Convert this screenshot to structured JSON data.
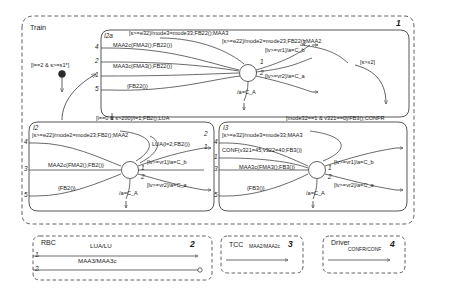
{
  "diagram": {
    "type": "statechart",
    "outer_block": {
      "name": "Train",
      "index": "1"
    },
    "regions": [
      {
        "id": "I2a",
        "name": "I2a",
        "top_labels": [
          "[s>=e32]/mode3=mode33;FB22();MAA3",
          "[s>=e22]/mode2=mode23;FB22();MAA2"
        ],
        "left_ports": [
          "4",
          "2",
          "1",
          "5"
        ],
        "right_ports": [
          "3",
          "1",
          "2"
        ],
        "edge_labels": [
          "MAA2c{FMA2();FB22()}",
          "MAA3c{FMA3();FB22()}",
          "{FB22()}",
          "/a=C_A",
          "[lv>=vr1]/a=C_b",
          "[lv>=vr2]/a=C_a"
        ]
      },
      {
        "id": "I2",
        "name": "I2",
        "top_labels": [
          "[l==0 & s>200]/l=1;FB2();LUA",
          "[s>=e22]/mode2=mode23;FB2();MAA2"
        ],
        "left_ports": [
          "4",
          "3",
          "5"
        ],
        "right_ports": [
          "2",
          "1",
          "1",
          "2"
        ],
        "edge_labels": [
          "LUA{l=2;FB2()}",
          "MAA2c{FMA2();FB2()}",
          "{FB2()}",
          "/a=C_A",
          "[lv>=vr1]/a=C_b",
          "[lv>=vr2]/a=C_a"
        ]
      },
      {
        "id": "I3",
        "name": "I3",
        "top_labels": [
          "[mode32==1 & v321==0]/FB3();CONFR",
          "[s>=e32]/mode3=mode33;MAA3"
        ],
        "left_ports": [
          "4",
          "1",
          "3",
          "5"
        ],
        "right_ports": [
          "1",
          "2"
        ],
        "edge_labels": [
          "CONF{v321=45;v322=40;FB3()}",
          "MAA3c{FMA3();FB3()}",
          "{FB3()}",
          "/a=C_A",
          "[lv>=vr1]/a=C_b",
          "[lv>=vr2]/a=C_a"
        ]
      }
    ],
    "transitions": [
      {
        "id": "init-guard",
        "label": "[l==2 & s>=s1*]"
      },
      {
        "id": "exit-guard",
        "label": "[s>x2]"
      }
    ],
    "bottom_blocks": [
      {
        "name": "RBC",
        "index": "2",
        "channels": [
          {
            "port": "1",
            "label": "LUA/LU",
            "arrow": "out"
          },
          {
            "port": "2",
            "label": "MAA3/MAA3c",
            "arrow": "in"
          }
        ]
      },
      {
        "name": "TCC",
        "index": "3",
        "channels": [
          {
            "port": "",
            "label": "MAA2/MAA2c",
            "arrow": "out"
          }
        ]
      },
      {
        "name": "Driver",
        "index": "4",
        "channels": [
          {
            "port": "",
            "label": "CONFR/CONF",
            "arrow": "out"
          }
        ]
      }
    ]
  },
  "colors": {
    "stroke": "#2b2b2b",
    "dash": "#3a3a3a",
    "fill": "#ffffff"
  }
}
